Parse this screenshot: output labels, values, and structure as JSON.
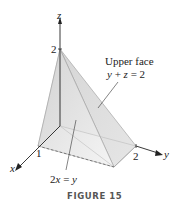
{
  "figure": {
    "caption": "FIGURE 15",
    "axes": {
      "x_label": "x",
      "y_label": "y",
      "z_label": "z",
      "x_tick": "1",
      "y_tick": "2",
      "z_tick": "2"
    },
    "annotations": {
      "upper_face_title": "Upper face",
      "upper_face_eq_y": "y",
      "upper_face_eq_rest": " + ",
      "upper_face_eq_z": "z",
      "upper_face_eq_end": " = 2",
      "plane_eq_2": "2",
      "plane_eq_x": "x",
      "plane_eq_eq": " = ",
      "plane_eq_y": "y"
    },
    "colors": {
      "face_light": "#eeeeee",
      "face_mid": "#dcdcdc",
      "face_dark": "#c8c8c8",
      "edge": "#9a9a9a",
      "axis": "#222222"
    }
  }
}
